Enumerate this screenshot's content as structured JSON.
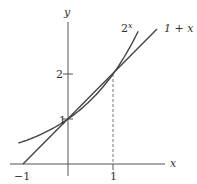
{
  "chart_data": {
    "type": "line",
    "title": "",
    "xlabel": "x",
    "ylabel": "y",
    "xlim": [
      -1.1,
      2.05
    ],
    "ylim": [
      0,
      3.4
    ],
    "grid": false,
    "x_ticks": [
      {
        "value": -1,
        "label": "−1"
      },
      {
        "value": 1,
        "label": "1"
      }
    ],
    "y_ticks": [
      {
        "value": 1,
        "label": "1"
      },
      {
        "value": 2,
        "label": "2"
      }
    ],
    "series": [
      {
        "name": "2^x",
        "label": "2",
        "label_sup": "x",
        "function": "2^x",
        "x_range": [
          -1.1,
          1.56
        ]
      },
      {
        "name": "1 + x",
        "label": "1 + x",
        "function": "1+x",
        "x_range": [
          -1,
          1.98
        ]
      }
    ],
    "annotations": [
      {
        "type": "dashed-vertical",
        "x": 1,
        "from_y": 0,
        "to_y": 2
      }
    ]
  }
}
